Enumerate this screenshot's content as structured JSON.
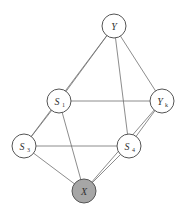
{
  "diagram": {
    "type": "graph",
    "colors": {
      "node_fill": "#ffffff",
      "observed_fill": "#a6a6a6",
      "edge": "#6e6e6e",
      "node_stroke": "#555555"
    },
    "nodes": [
      {
        "id": "Y",
        "label": "Y",
        "sub": "",
        "x": 114,
        "y": 26,
        "observed": false
      },
      {
        "id": "S1",
        "label": "S",
        "sub": "1",
        "x": 59,
        "y": 101,
        "observed": false
      },
      {
        "id": "Yk",
        "label": "Y",
        "sub": "k",
        "x": 162,
        "y": 101,
        "observed": false
      },
      {
        "id": "S3",
        "label": "S",
        "sub": "3",
        "x": 24,
        "y": 146,
        "observed": false
      },
      {
        "id": "S4",
        "label": "S",
        "sub": "4",
        "x": 129,
        "y": 146,
        "observed": false
      },
      {
        "id": "X",
        "label": "X",
        "sub": "",
        "x": 84,
        "y": 191,
        "observed": true
      }
    ],
    "edges": [
      [
        "Y",
        "S1"
      ],
      [
        "Y",
        "S3"
      ],
      [
        "Y",
        "S4"
      ],
      [
        "Y",
        "Yk"
      ],
      [
        "S1",
        "Yk"
      ],
      [
        "S1",
        "S3"
      ],
      [
        "S1",
        "X"
      ],
      [
        "S3",
        "S4"
      ],
      [
        "S3",
        "X"
      ],
      [
        "S4",
        "X"
      ],
      [
        "S4",
        "Yk"
      ],
      [
        "X",
        "Yk"
      ]
    ]
  }
}
